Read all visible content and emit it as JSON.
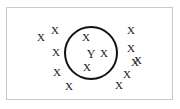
{
  "figure": {
    "panel": {
      "border_color": "#c9c9c9",
      "background_color": "#ffffff",
      "left": 6,
      "top": 7,
      "width": 167,
      "height": 93
    },
    "circle": {
      "label": "cluster-boundary-circle",
      "center_x": 91,
      "center_y": 53,
      "radius": 27,
      "stroke_color": "#111111",
      "stroke_width": 2.4
    },
    "marks_inside": [
      {
        "glyph": "X",
        "x": 86,
        "y": 37
      },
      {
        "glyph": "Y",
        "x": 91,
        "y": 54
      },
      {
        "glyph": "X",
        "x": 104,
        "y": 53
      },
      {
        "glyph": "X",
        "x": 87,
        "y": 67
      }
    ],
    "marks_outside": [
      {
        "glyph": "X",
        "x": 41,
        "y": 37
      },
      {
        "glyph": "X",
        "x": 55,
        "y": 30
      },
      {
        "glyph": "X",
        "x": 56,
        "y": 52
      },
      {
        "glyph": "X",
        "x": 57,
        "y": 72
      },
      {
        "glyph": "X",
        "x": 69,
        "y": 86
      },
      {
        "glyph": "X",
        "x": 131,
        "y": 30
      },
      {
        "glyph": "X",
        "x": 131,
        "y": 48
      },
      {
        "glyph": "X",
        "x": 138,
        "y": 60
      },
      {
        "glyph": "X",
        "x": 135,
        "y": 62
      },
      {
        "glyph": "X",
        "x": 127,
        "y": 74
      },
      {
        "glyph": "X",
        "x": 119,
        "y": 85
      }
    ]
  }
}
